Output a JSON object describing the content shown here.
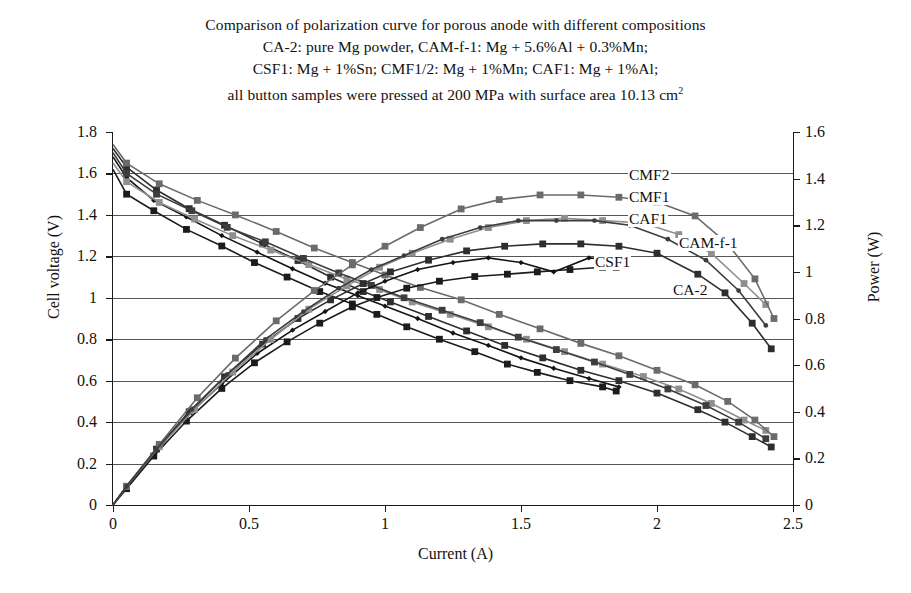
{
  "title": {
    "lines": [
      "Comparison of polarization curve for porous anode with different compositions",
      "CA-2: pure Mg powder, CAM-f-1: Mg + 5.6%Al + 0.3%Mn;",
      "CSF1: Mg + 1%Sn; CMF1/2: Mg + 1%Mn; CAF1: Mg + 1%Al;",
      "all button samples were pressed at 200 MPa with surface area 10.13 cm"
    ],
    "superscript": "2"
  },
  "axes": {
    "x_label": "Current (A)",
    "y_left_label": "Cell voltage (V)",
    "y_right_label": "Power (W)",
    "x_ticks": [
      "0",
      "0.5",
      "1",
      "1.5",
      "2",
      "2.5"
    ],
    "y_left_ticks": [
      "0",
      "0.2",
      "0.4",
      "0.6",
      "0.8",
      "1",
      "1.2",
      "1.4",
      "1.6",
      "1.8"
    ],
    "y_right_ticks": [
      "0",
      "0.2",
      "0.4",
      "0.6",
      "0.8",
      "1",
      "1.2",
      "1.4",
      "1.6"
    ]
  },
  "series_labels": [
    {
      "name": "CMF2",
      "x": 628,
      "y": 167
    },
    {
      "name": "CMF1",
      "x": 628,
      "y": 189
    },
    {
      "name": "CAF1",
      "x": 628,
      "y": 211
    },
    {
      "name": "CAM-f-1",
      "x": 678,
      "y": 235
    },
    {
      "name": "CSF1",
      "x": 594,
      "y": 254
    },
    {
      "name": "CA-2",
      "x": 672,
      "y": 282
    }
  ],
  "colors": {
    "axis": "#1a1a1a",
    "grid": "#555555",
    "CA-2": "#1c1c1c",
    "CAM-f-1": "#2e2e2e",
    "CSF1": "#141414",
    "CMF1": "#8f8f8f",
    "CMF2": "#6b6b6b",
    "CAF1": "#3d3d3d"
  },
  "chart_data": {
    "type": "line",
    "title": "Comparison of polarization curve for porous anode with different compositions",
    "xlabel": "Current (A)",
    "ylabel": "Cell voltage (V)",
    "ylabel_secondary": "Power (W)",
    "xlim": [
      0,
      2.5
    ],
    "ylim": [
      0,
      1.8
    ],
    "ylim_secondary": [
      0,
      1.6
    ],
    "grid": "horizontal",
    "legend": "inline-right-annotations",
    "voltage_series": [
      {
        "name": "CA-2",
        "axis": "left",
        "marker": "square",
        "color": "#1c1c1c",
        "x": [
          0.0,
          0.05,
          0.15,
          0.27,
          0.4,
          0.52,
          0.64,
          0.76,
          0.88,
          0.97,
          1.08,
          1.2,
          1.33,
          1.45,
          1.56,
          1.68,
          1.8,
          1.85
        ],
        "y": [
          1.62,
          1.5,
          1.42,
          1.33,
          1.25,
          1.17,
          1.1,
          1.03,
          0.97,
          0.92,
          0.86,
          0.8,
          0.74,
          0.68,
          0.64,
          0.6,
          0.57,
          0.55
        ]
      },
      {
        "name": "CAM-f-1",
        "axis": "left",
        "marker": "square",
        "color": "#2e2e2e",
        "x": [
          0.0,
          0.05,
          0.16,
          0.28,
          0.41,
          0.55,
          0.68,
          0.8,
          0.92,
          1.02,
          1.16,
          1.3,
          1.44,
          1.58,
          1.72,
          1.86,
          2.0,
          2.15,
          2.25,
          2.35,
          2.42
        ],
        "y": [
          1.72,
          1.63,
          1.52,
          1.43,
          1.35,
          1.26,
          1.18,
          1.1,
          1.03,
          0.98,
          0.91,
          0.84,
          0.77,
          0.71,
          0.65,
          0.6,
          0.54,
          0.46,
          0.4,
          0.33,
          0.28
        ]
      },
      {
        "name": "CSF1",
        "axis": "left",
        "marker": "diamond",
        "color": "#141414",
        "x": [
          0.0,
          0.05,
          0.15,
          0.27,
          0.4,
          0.53,
          0.66,
          0.78,
          0.9,
          1.0,
          1.12,
          1.25,
          1.38,
          1.5,
          1.62,
          1.75,
          1.86
        ],
        "y": [
          1.68,
          1.58,
          1.47,
          1.39,
          1.3,
          1.22,
          1.14,
          1.07,
          1.01,
          0.96,
          0.9,
          0.83,
          0.77,
          0.71,
          0.66,
          0.61,
          0.57
        ]
      },
      {
        "name": "CMF1",
        "axis": "left",
        "marker": "square",
        "color": "#8f8f8f",
        "x": [
          0.0,
          0.05,
          0.17,
          0.3,
          0.44,
          0.58,
          0.72,
          0.86,
          0.98,
          1.1,
          1.24,
          1.38,
          1.52,
          1.66,
          1.8,
          1.95,
          2.08,
          2.2,
          2.32,
          2.4
        ],
        "y": [
          1.65,
          1.56,
          1.46,
          1.38,
          1.3,
          1.23,
          1.16,
          1.09,
          1.04,
          0.98,
          0.92,
          0.86,
          0.8,
          0.74,
          0.68,
          0.62,
          0.56,
          0.49,
          0.41,
          0.36
        ]
      },
      {
        "name": "CMF2",
        "axis": "left",
        "marker": "square",
        "color": "#6b6b6b",
        "x": [
          0.0,
          0.05,
          0.17,
          0.31,
          0.45,
          0.6,
          0.74,
          0.88,
          1.0,
          1.13,
          1.28,
          1.42,
          1.57,
          1.72,
          1.86,
          2.0,
          2.14,
          2.26,
          2.36,
          2.43
        ],
        "y": [
          1.74,
          1.65,
          1.55,
          1.47,
          1.4,
          1.32,
          1.24,
          1.17,
          1.11,
          1.05,
          0.99,
          0.92,
          0.85,
          0.78,
          0.72,
          0.65,
          0.58,
          0.5,
          0.41,
          0.33
        ]
      },
      {
        "name": "CAF1",
        "axis": "left",
        "marker": "square",
        "color": "#3d3d3d",
        "x": [
          0.0,
          0.05,
          0.16,
          0.29,
          0.42,
          0.56,
          0.7,
          0.83,
          0.95,
          1.07,
          1.21,
          1.35,
          1.49,
          1.63,
          1.77,
          1.9,
          2.04,
          2.18,
          2.3,
          2.4
        ],
        "y": [
          1.7,
          1.6,
          1.5,
          1.42,
          1.34,
          1.27,
          1.19,
          1.12,
          1.06,
          1.0,
          0.94,
          0.88,
          0.81,
          0.75,
          0.69,
          0.63,
          0.56,
          0.48,
          0.4,
          0.32
        ]
      }
    ],
    "power_series": [
      {
        "name": "CA-2",
        "axis": "right",
        "marker": "square",
        "color": "#1c1c1c",
        "x": [
          0.0,
          0.05,
          0.15,
          0.27,
          0.4,
          0.52,
          0.64,
          0.76,
          0.88,
          0.97,
          1.08,
          1.2,
          1.33,
          1.45,
          1.56,
          1.68,
          1.8,
          1.85
        ],
        "y": [
          0.0,
          0.07,
          0.21,
          0.36,
          0.5,
          0.61,
          0.7,
          0.78,
          0.85,
          0.89,
          0.93,
          0.96,
          0.98,
          0.99,
          1.0,
          1.01,
          1.02,
          1.02
        ]
      },
      {
        "name": "CAM-f-1",
        "axis": "right",
        "marker": "square",
        "color": "#2e2e2e",
        "x": [
          0.0,
          0.05,
          0.16,
          0.28,
          0.41,
          0.55,
          0.68,
          0.8,
          0.92,
          1.02,
          1.16,
          1.3,
          1.44,
          1.58,
          1.72,
          1.86,
          2.0,
          2.15,
          2.25,
          2.35,
          2.42
        ],
        "y": [
          0.0,
          0.08,
          0.24,
          0.4,
          0.55,
          0.69,
          0.8,
          0.88,
          0.95,
          1.0,
          1.05,
          1.09,
          1.11,
          1.12,
          1.12,
          1.11,
          1.08,
          0.99,
          0.91,
          0.78,
          0.67
        ]
      },
      {
        "name": "CSF1",
        "axis": "right",
        "marker": "diamond",
        "color": "#141414",
        "x": [
          0.0,
          0.05,
          0.15,
          0.27,
          0.4,
          0.53,
          0.66,
          0.78,
          0.9,
          1.0,
          1.12,
          1.25,
          1.38,
          1.5,
          1.62,
          1.75,
          1.86
        ],
        "y": [
          0.0,
          0.08,
          0.22,
          0.38,
          0.52,
          0.65,
          0.75,
          0.83,
          0.91,
          0.96,
          1.01,
          1.04,
          1.06,
          1.04,
          1.0,
          1.06,
          1.05
        ]
      },
      {
        "name": "CMF1",
        "axis": "right",
        "marker": "square",
        "color": "#8f8f8f",
        "x": [
          0.0,
          0.05,
          0.17,
          0.3,
          0.44,
          0.58,
          0.72,
          0.86,
          0.98,
          1.1,
          1.24,
          1.38,
          1.52,
          1.66,
          1.8,
          1.95,
          2.08,
          2.2,
          2.32,
          2.4
        ],
        "y": [
          0.0,
          0.08,
          0.25,
          0.41,
          0.57,
          0.71,
          0.84,
          0.94,
          1.02,
          1.08,
          1.14,
          1.19,
          1.22,
          1.23,
          1.22,
          1.21,
          1.16,
          1.08,
          0.95,
          0.86
        ]
      },
      {
        "name": "CMF2",
        "axis": "right",
        "marker": "square",
        "color": "#6b6b6b",
        "x": [
          0.0,
          0.05,
          0.17,
          0.31,
          0.45,
          0.6,
          0.74,
          0.88,
          1.0,
          1.13,
          1.28,
          1.42,
          1.57,
          1.72,
          1.86,
          2.0,
          2.14,
          2.26,
          2.36,
          2.43
        ],
        "y": [
          0.0,
          0.08,
          0.26,
          0.46,
          0.63,
          0.79,
          0.92,
          1.03,
          1.11,
          1.19,
          1.27,
          1.31,
          1.33,
          1.33,
          1.32,
          1.3,
          1.24,
          1.12,
          0.97,
          0.8
        ]
      },
      {
        "name": "CAF1",
        "axis": "right",
        "marker": "circle",
        "color": "#3d3d3d",
        "x": [
          0.0,
          0.05,
          0.16,
          0.29,
          0.42,
          0.56,
          0.7,
          0.83,
          0.95,
          1.07,
          1.21,
          1.35,
          1.49,
          1.63,
          1.77,
          1.9,
          2.04,
          2.18,
          2.3,
          2.4
        ],
        "y": [
          0.0,
          0.08,
          0.24,
          0.41,
          0.56,
          0.71,
          0.83,
          0.93,
          1.01,
          1.07,
          1.14,
          1.19,
          1.22,
          1.22,
          1.22,
          1.2,
          1.14,
          1.05,
          0.92,
          0.77
        ]
      }
    ]
  }
}
